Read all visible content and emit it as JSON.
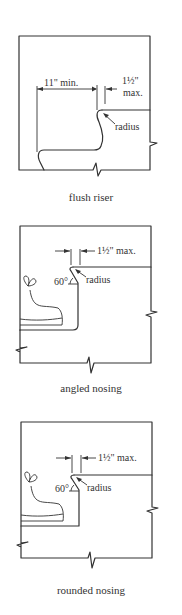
{
  "figures": [
    {
      "id": "flush-riser",
      "caption": "flush riser",
      "labels": {
        "tread_depth": "11\" min.",
        "nosing_projection_line1": "1½\"",
        "nosing_projection_line2": "max.",
        "radius": "radius"
      }
    },
    {
      "id": "angled-nosing",
      "caption": "angled nosing",
      "labels": {
        "nosing_projection": "1½\" max.",
        "angle": "60°",
        "radius": "radius"
      }
    },
    {
      "id": "rounded-nosing",
      "caption": "rounded nosing",
      "labels": {
        "nosing_projection": "1½\" max.",
        "angle": "60°",
        "radius": "radius"
      }
    }
  ],
  "colors": {
    "line": "#333333",
    "background": "#ffffff"
  }
}
